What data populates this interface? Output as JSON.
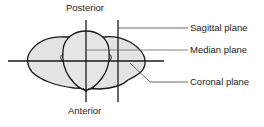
{
  "diagram": {
    "orientation_labels": {
      "top": "Posterior",
      "bottom": "Anterior"
    },
    "plane_labels": [
      {
        "id": "sagittal",
        "label": "Sagittal plane"
      },
      {
        "id": "median",
        "label": "Median plane"
      },
      {
        "id": "coronal",
        "label": "Coronal plane"
      }
    ],
    "colors": {
      "line": "#1a1a1a",
      "fill": "#e3e3e3",
      "text": "#222222",
      "leader": "#444444"
    }
  }
}
